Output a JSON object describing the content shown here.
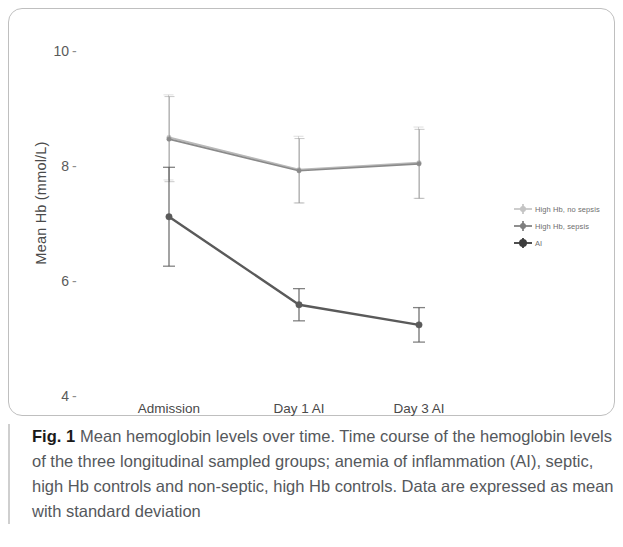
{
  "figure": {
    "caption_label": "Fig. 1",
    "caption_text": "Mean hemoglobin levels over time. Time course of the hemoglobin levels of the three longitudinal sampled groups; anemia of inflammation (AI), septic, high Hb controls and non-septic, high Hb controls. Data are expressed as mean with standard deviation"
  },
  "chart_data": {
    "type": "line",
    "title": "",
    "xlabel": "",
    "ylabel": "Mean Hb (mmol/L)",
    "categories": [
      "Admission",
      "Day 1 AI",
      "Day 3 AI"
    ],
    "ylim": [
      3.4,
      10.4
    ],
    "yticks": [
      10,
      8,
      6,
      4
    ],
    "ytick_labels": [
      "10",
      "8",
      "6",
      "4"
    ],
    "grid": false,
    "legend_position": "right",
    "errorbars": "standard deviation",
    "series": [
      {
        "name": "High Hb, no sepsis",
        "color": "#b9b9b9",
        "values": [
          8.48,
          7.92,
          8.04
        ],
        "err_low": [
          0.74,
          0.58,
          0.62
        ],
        "err_high": [
          0.74,
          0.58,
          0.62
        ]
      },
      {
        "name": "High Hb, sepsis",
        "color": "#8a8a8a",
        "values": [
          8.45,
          7.9,
          8.02
        ],
        "err_low": [
          0.74,
          0.56,
          0.6
        ],
        "err_high": [
          0.74,
          0.56,
          0.6
        ]
      },
      {
        "name": "AI",
        "color": "#5a5a5a",
        "values": [
          7.1,
          5.57,
          5.22
        ],
        "err_low": [
          0.86,
          0.28,
          0.3
        ],
        "err_high": [
          0.86,
          0.28,
          0.3
        ]
      }
    ]
  },
  "legend": {
    "items": [
      {
        "label": "High Hb, no sepsis",
        "marker": "errorbar-marker-light"
      },
      {
        "label": "High Hb, sepsis",
        "marker": "errorbar-marker-medium"
      },
      {
        "label": "AI",
        "marker": "errorbar-marker-dark"
      }
    ]
  },
  "axis": {
    "y_title": "Mean Hb (mmol/L)",
    "y_ticks": [
      "10",
      "8",
      "6",
      "4"
    ],
    "tick_dash": "-",
    "x_ticks": [
      "Admission",
      "Day 1 AI",
      "Day 3 AI"
    ]
  }
}
